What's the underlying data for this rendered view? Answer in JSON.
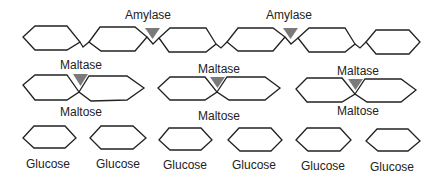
{
  "diagram": {
    "title": "",
    "row1": {
      "description": "Starch chain of 6 glucose units cut by amylase",
      "units": 6,
      "enzymes": [
        {
          "label": "Amylase",
          "x": 148
        },
        {
          "label": "Amylase",
          "x": 288
        }
      ]
    },
    "row2": {
      "description": "Maltose molecules being split by maltase",
      "pairs": [
        {
          "enzyme_label": "Maltase",
          "product_label": "Maltose"
        },
        {
          "enzyme_label": "Maltase",
          "product_label": "Maltose"
        },
        {
          "enzyme_label": "Maltase",
          "product_label": "Maltose"
        }
      ]
    },
    "row3": {
      "description": "Individual glucose molecules",
      "items": [
        {
          "label": "Glucose"
        },
        {
          "label": "Glucose"
        },
        {
          "label": "Glucose"
        },
        {
          "label": "Glucose"
        },
        {
          "label": "Glucose"
        },
        {
          "label": "Glucose"
        }
      ]
    },
    "colors": {
      "outline": "#222222",
      "enzyme": "#7a7a7a",
      "background": "#ffffff"
    }
  }
}
